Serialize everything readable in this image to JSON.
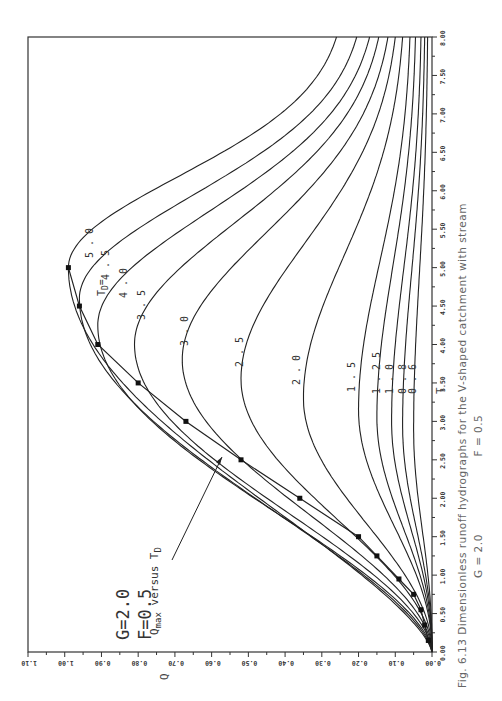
{
  "figure": {
    "caption_line1": "Fig. 6.13    Dimensionless runoff hydrographs for the V-shaped catchment with stream",
    "caption_line2_g": "G = 2.0",
    "caption_line2_f": "F = 0.5",
    "params_g": "G=2.0",
    "params_f": "F=0.5",
    "td_label": "T",
    "td_sub": "D",
    "td_eq": "=",
    "qmax_label_main": "Q",
    "qmax_label_sub": "max",
    "qmax_label_rest": " versus T",
    "qmax_label_rest_sub": "D"
  },
  "chart_data": {
    "type": "line",
    "title": "Dimensionless runoff hydrographs for the V-shaped catchment with stream",
    "subtitle": "G = 2.0, F = 0.5",
    "figure_number": "Fig. 6.13",
    "orientation": "rotated 90° (T axis vertical on right, Q axis horizontal at bottom)",
    "xlabel": "T",
    "ylabel": "Q",
    "xlim": [
      0,
      8
    ],
    "ylim": [
      0,
      1.1
    ],
    "x_ticks": [
      "0.00",
      "0.50",
      "1.00",
      "1.50",
      "2.00",
      "2.50",
      "3.00",
      "3.50",
      "4.00",
      "4.50",
      "5.00",
      "5.50",
      "6.00",
      "6.50",
      "7.00",
      "7.50",
      "8.00"
    ],
    "y_ticks": [
      "0.00",
      "0.10",
      "0.20",
      "0.30",
      "0.40",
      "0.50",
      "0.60",
      "0.70",
      "0.80",
      "0.90",
      "1.00",
      "1.10"
    ],
    "grid": false,
    "legend": "curves labeled by T_D",
    "annotations": [
      "G=2.0",
      "F=0.5",
      "T_D =",
      "Q_max versus T_D"
    ],
    "series": [
      {
        "name": "T_D=0.6",
        "td": 0.6,
        "peak_t": 2.9,
        "peak_q": 0.05,
        "end_q": 0.012
      },
      {
        "name": "T_D=0.8",
        "td": 0.8,
        "peak_t": 2.95,
        "peak_q": 0.08,
        "end_q": 0.02
      },
      {
        "name": "T_D=1.0",
        "td": 1.0,
        "peak_t": 3.0,
        "peak_q": 0.11,
        "end_q": 0.03
      },
      {
        "name": "T_D=1.25",
        "td": 1.25,
        "peak_t": 3.05,
        "peak_q": 0.15,
        "end_q": 0.045
      },
      {
        "name": "T_D=1.5",
        "td": 1.5,
        "peak_t": 3.15,
        "peak_q": 0.2,
        "end_q": 0.06
      },
      {
        "name": "T_D=2.0",
        "td": 2.0,
        "peak_t": 3.3,
        "peak_q": 0.35,
        "end_q": 0.08
      },
      {
        "name": "T_D=2.5",
        "td": 2.5,
        "peak_t": 3.55,
        "peak_q": 0.52,
        "end_q": 0.1
      },
      {
        "name": "T_D=3.0",
        "td": 3.0,
        "peak_t": 3.8,
        "peak_q": 0.68,
        "end_q": 0.12
      },
      {
        "name": "T_D=3.5",
        "td": 3.5,
        "peak_t": 4.0,
        "peak_q": 0.81,
        "end_q": 0.145
      },
      {
        "name": "T_D=4.0",
        "td": 4.0,
        "peak_t": 4.25,
        "peak_q": 0.91,
        "end_q": 0.17
      },
      {
        "name": "T_D=4.5",
        "td": 4.5,
        "peak_t": 4.6,
        "peak_q": 0.96,
        "end_q": 0.205
      },
      {
        "name": "T_D=5.0",
        "td": 5.0,
        "peak_t": 5.0,
        "peak_q": 0.99,
        "end_q": 0.26
      }
    ],
    "qmax_vs_td": {
      "name": "Q_max versus T_D",
      "t": [
        0.15,
        0.35,
        0.55,
        0.75,
        0.95,
        1.25,
        1.5,
        2.0,
        2.5,
        3.0,
        3.5,
        4.0,
        4.5,
        5.0
      ],
      "q": [
        0.01,
        0.02,
        0.03,
        0.05,
        0.09,
        0.15,
        0.2,
        0.36,
        0.52,
        0.67,
        0.8,
        0.91,
        0.96,
        0.99
      ]
    },
    "curve_labels": [
      "5.0",
      "4.5",
      "4.0",
      "3.5",
      "3.0",
      "2.5",
      "2.0",
      "1.5",
      "1.25",
      "1.0",
      "0.8",
      "0.6"
    ]
  }
}
